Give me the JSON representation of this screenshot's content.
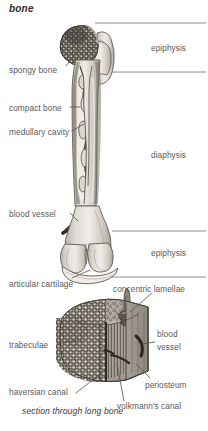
{
  "figure": {
    "title": "bone",
    "caption": "section through long bone"
  },
  "region_labels": [
    {
      "id": "epiphysis-proximal",
      "text": "epiphysis",
      "x": 151,
      "y": 44
    },
    {
      "id": "diaphysis",
      "text": "diaphysis",
      "x": 151,
      "y": 151
    },
    {
      "id": "epiphysis-distal",
      "text": "epiphysis",
      "x": 151,
      "y": 249
    }
  ],
  "callouts_upper": [
    {
      "id": "spongy-bone",
      "text": "spongy bone",
      "x": 9,
      "y": 66
    },
    {
      "id": "compact-bone",
      "text": "compact bone",
      "x": 9,
      "y": 104
    },
    {
      "id": "medullary-cavity",
      "text": "medullary cavity",
      "x": 9,
      "y": 128
    },
    {
      "id": "blood-vessel-femur",
      "text": "blood vessel",
      "x": 9,
      "y": 210
    },
    {
      "id": "articular-cartilage",
      "text": "articular cartilage",
      "x": 9,
      "y": 280
    }
  ],
  "callouts_lower": [
    {
      "id": "concentric-lamellae",
      "text": "concentric lamellae",
      "x": 113,
      "y": 285
    },
    {
      "id": "trabeculae",
      "text": "trabeculae",
      "x": 9,
      "y": 341
    },
    {
      "id": "blood-vessel-section",
      "text": "blood",
      "x": 157,
      "y": 334
    },
    {
      "id": "blood-vessel-section2",
      "text": "vessel",
      "x": 157,
      "y": 347
    },
    {
      "id": "periosteum",
      "text": "periosteum",
      "x": 145,
      "y": 381
    },
    {
      "id": "haversian-canal",
      "text": "haversian canal",
      "x": 9,
      "y": 391
    },
    {
      "id": "volkmanns-canal",
      "text": "volkmann's canal",
      "x": 118,
      "y": 405
    }
  ],
  "divider_lines": [
    {
      "id": "divider-1",
      "y": 23,
      "x1": 95,
      "x2": 206
    },
    {
      "id": "divider-2",
      "y": 72,
      "x1": 108,
      "x2": 206
    },
    {
      "id": "divider-3",
      "y": 231,
      "x1": 112,
      "x2": 206
    },
    {
      "id": "divider-4",
      "y": 277,
      "x1": 112,
      "x2": 206
    }
  ],
  "palette": {
    "ink": "#3a3a3a",
    "label_text": "#5a5a5a",
    "bone_light": "#e8e5e0",
    "bone_mid": "#cfcac2",
    "bone_shade": "#b3ada4",
    "marrow_dark": "#4a463f",
    "spongy_dark": "#55514a",
    "section_body": "#bfb9b0",
    "paper": "#ffffff"
  },
  "figure_elements": [
    {
      "id": "femur-head",
      "name": "femur head (spongy bone, proximal epiphysis)"
    },
    {
      "id": "greater-trochanter",
      "name": "greater trochanter"
    },
    {
      "id": "femur-shaft",
      "name": "diaphysis shaft with medullary cavity"
    },
    {
      "id": "femur-condyles",
      "name": "distal condyles with articular cartilage"
    },
    {
      "id": "nutrient-vessel",
      "name": "nutrient blood vessel entering shaft"
    },
    {
      "id": "section-block",
      "name": "cut block showing trabeculae, osteons, periosteum"
    }
  ]
}
